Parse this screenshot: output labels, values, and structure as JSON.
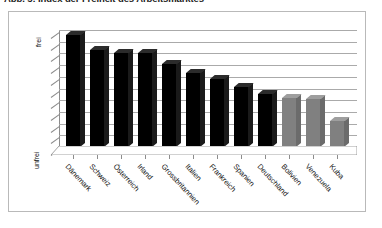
{
  "title": "Abb. 5: Index der Freiheit des Arbeitsmarktes",
  "axes": {
    "y_top_label": "frei",
    "y_bottom_label": "unfrei"
  },
  "colors": {
    "bar_primary": "#000000",
    "bar_secondary": "#808080",
    "bar_top_primary": "#2b2b2b",
    "bar_top_secondary": "#9e9e9e",
    "bar_side_primary": "#1a1a1a",
    "bar_side_secondary": "#6b6b6b",
    "gridline": "#aaaaaa",
    "axis": "#8c8c8c",
    "frame": "#b9b9b9",
    "background": "#ffffff",
    "text": "#111111"
  },
  "chart_data": {
    "type": "bar",
    "title": "Abb. 5: Index der Freiheit des Arbeitsmarktes",
    "xlabel": "",
    "ylabel": "",
    "ylim": [
      0,
      10
    ],
    "grid": true,
    "gridlines": 10,
    "legend": "none",
    "y_tick_labels": [
      "unfrei",
      "frei"
    ],
    "categories": [
      "Dänemark",
      "Schweiz",
      "Österreich",
      "Irland",
      "Grossbritannien",
      "Italien",
      "Frankreich",
      "Spanien",
      "Deutschland",
      "Bolivien",
      "Venezuela",
      "Kuba"
    ],
    "values": [
      9.6,
      8.3,
      8.0,
      8.0,
      7.1,
      6.3,
      5.8,
      5.1,
      4.5,
      4.2,
      4.1,
      2.2
    ],
    "bar_groups": [
      {
        "name": "freie Arbeitsmärkte",
        "color": "#000000",
        "indices": [
          0,
          1,
          2,
          3,
          4,
          5,
          6,
          7,
          8
        ]
      },
      {
        "name": "unfreie Arbeitsmärkte",
        "color": "#808080",
        "indices": [
          9,
          10,
          11
        ]
      }
    ]
  }
}
